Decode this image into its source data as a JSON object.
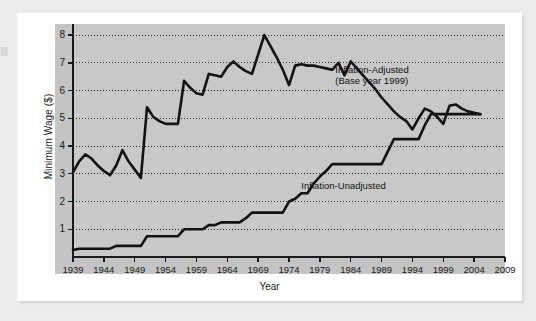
{
  "figure": {
    "background_color": "#ebebeb",
    "card_color": "#ffffff",
    "plot_background_color": "#c8c8c8",
    "line_color": "#121212"
  },
  "chart_data": {
    "type": "line",
    "title": "",
    "xlabel": "Year",
    "ylabel": "Minimum Wage ($)",
    "xlim": [
      1939,
      2009
    ],
    "ylim": [
      0,
      8.4
    ],
    "grid": "horizontal-dotted",
    "legend_position": "inline-annotations",
    "x_tick_labels": [
      "1939",
      "1944",
      "1949",
      "1954",
      "1959",
      "1964",
      "1969",
      "1974",
      "1979",
      "1984",
      "1989",
      "1994",
      "1999",
      "2004",
      "2009"
    ],
    "y_tick_labels": [
      "1",
      "2",
      "3",
      "4",
      "5",
      "6",
      "7",
      "8"
    ],
    "x_ticks": [
      1939,
      1944,
      1949,
      1954,
      1959,
      1964,
      1969,
      1974,
      1979,
      1984,
      1989,
      1994,
      1999,
      2004,
      2009
    ],
    "y_ticks": [
      1,
      2,
      3,
      4,
      5,
      6,
      7,
      8
    ],
    "annotations": [
      {
        "name": "inflation-adjusted-label",
        "line1": "Inflation-Adjusted",
        "line2": "(Base year 1999)",
        "x": 1981.5,
        "y": 6.75
      },
      {
        "name": "inflation-unadjusted-label",
        "line1": "Inflation-Unadjusted",
        "line2": "",
        "x": 1976.0,
        "y": 2.55
      }
    ],
    "series": [
      {
        "name": "Inflation-Adjusted (Base year 1999)",
        "x": [
          1939,
          1940,
          1941,
          1942,
          1943,
          1944,
          1945,
          1946,
          1947,
          1948,
          1949,
          1950,
          1951,
          1952,
          1953,
          1954,
          1955,
          1956,
          1957,
          1958,
          1959,
          1960,
          1961,
          1962,
          1963,
          1964,
          1965,
          1966,
          1967,
          1968,
          1969,
          1970,
          1971,
          1972,
          1973,
          1974,
          1975,
          1976,
          1977,
          1978,
          1979,
          1980,
          1981,
          1982,
          1983,
          1984,
          1985,
          1986,
          1987,
          1988,
          1989,
          1990,
          1991,
          1992,
          1993,
          1994,
          1995,
          1996,
          1997,
          1998,
          1999,
          2000,
          2001,
          2002,
          2003,
          2004,
          2005
        ],
        "values": [
          3.05,
          3.45,
          3.7,
          3.55,
          3.3,
          3.1,
          2.95,
          3.3,
          3.85,
          3.45,
          3.15,
          2.85,
          5.4,
          5.05,
          4.9,
          4.8,
          4.8,
          4.8,
          6.35,
          6.1,
          5.9,
          5.85,
          6.6,
          6.55,
          6.5,
          6.85,
          7.05,
          6.85,
          6.7,
          6.6,
          7.3,
          8.0,
          7.6,
          7.2,
          6.75,
          6.2,
          6.9,
          6.95,
          6.9,
          6.9,
          6.85,
          6.8,
          6.75,
          7.0,
          6.55,
          7.05,
          6.8,
          6.55,
          6.3,
          6.05,
          5.75,
          5.5,
          5.25,
          5.05,
          4.9,
          4.6,
          5.0,
          5.35,
          5.25,
          5.05,
          4.8,
          5.45,
          5.5,
          5.35,
          5.25,
          5.2,
          5.15
        ]
      },
      {
        "name": "Inflation-Unadjusted",
        "x": [
          1939,
          1940,
          1941,
          1942,
          1943,
          1944,
          1945,
          1946,
          1947,
          1948,
          1949,
          1950,
          1951,
          1952,
          1953,
          1954,
          1955,
          1956,
          1957,
          1958,
          1959,
          1960,
          1961,
          1962,
          1963,
          1964,
          1965,
          1966,
          1967,
          1968,
          1969,
          1970,
          1971,
          1972,
          1973,
          1974,
          1975,
          1976,
          1977,
          1978,
          1979,
          1980,
          1981,
          1982,
          1983,
          1984,
          1985,
          1986,
          1987,
          1988,
          1989,
          1990,
          1991,
          1992,
          1993,
          1994,
          1995,
          1996,
          1997,
          1998,
          1999,
          2000,
          2001,
          2002,
          2003,
          2004,
          2005
        ],
        "values": [
          0.25,
          0.3,
          0.3,
          0.3,
          0.3,
          0.3,
          0.3,
          0.4,
          0.4,
          0.4,
          0.4,
          0.4,
          0.75,
          0.75,
          0.75,
          0.75,
          0.75,
          0.75,
          1.0,
          1.0,
          1.0,
          1.0,
          1.15,
          1.15,
          1.25,
          1.25,
          1.25,
          1.25,
          1.4,
          1.6,
          1.6,
          1.6,
          1.6,
          1.6,
          1.6,
          2.0,
          2.1,
          2.3,
          2.3,
          2.65,
          2.9,
          3.1,
          3.35,
          3.35,
          3.35,
          3.35,
          3.35,
          3.35,
          3.35,
          3.35,
          3.35,
          3.8,
          4.25,
          4.25,
          4.25,
          4.25,
          4.25,
          4.75,
          5.15,
          5.15,
          5.15,
          5.15,
          5.15,
          5.15,
          5.15,
          5.15,
          5.15
        ]
      }
    ]
  }
}
